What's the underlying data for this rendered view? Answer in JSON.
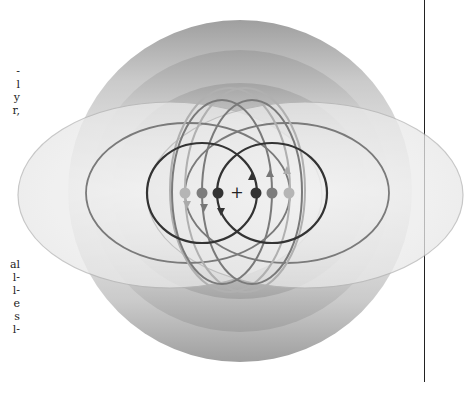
{
  "page": {
    "text_fragments_upper": [
      "-",
      "l",
      "y",
      "r,"
    ],
    "text_fragments_lower": [
      "al",
      "l-",
      "l-",
      "e",
      "s",
      "l-"
    ]
  },
  "figure": {
    "center_label": "+",
    "colors": {
      "dark": "#333333",
      "medium": "#6e6e6e",
      "light": "#a8a8a8",
      "shade_dark": "#8a8a8a",
      "shade_light": "#f2f2f2"
    },
    "charges_left": [
      {
        "x": 185,
        "y": 193,
        "tone": "light"
      },
      {
        "x": 202,
        "y": 193,
        "tone": "medium"
      },
      {
        "x": 218,
        "y": 193,
        "tone": "dark"
      }
    ],
    "charges_right": [
      {
        "x": 256,
        "y": 193,
        "tone": "dark"
      },
      {
        "x": 272,
        "y": 193,
        "tone": "medium"
      },
      {
        "x": 289,
        "y": 193,
        "tone": "light"
      }
    ]
  }
}
